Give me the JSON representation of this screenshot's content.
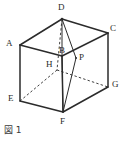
{
  "figure": {
    "caption": "図 1",
    "kind": "cube-diagram",
    "width": 124,
    "height": 141,
    "background_color": "#ffffff",
    "line_color": "#2b2b2b",
    "label_color": "#2b2b2b"
  },
  "labels": {
    "A": "A",
    "B": "B",
    "C": "C",
    "D": "D",
    "E": "E",
    "F": "F",
    "G": "G",
    "H": "H",
    "P": "P"
  },
  "geometry": {
    "vertices": {
      "A": {
        "x": 20,
        "y": 45
      },
      "B": {
        "x": 62,
        "y": 56
      },
      "C": {
        "x": 108,
        "y": 33
      },
      "D": {
        "x": 62,
        "y": 19
      },
      "E": {
        "x": 20,
        "y": 101
      },
      "F": {
        "x": 63,
        "y": 112
      },
      "G": {
        "x": 108,
        "y": 87
      },
      "H": {
        "x": 57,
        "y": 70
      },
      "P": {
        "x": 76,
        "y": 58
      }
    },
    "label_offsets": {
      "A": {
        "x": 6,
        "y": 39
      },
      "B": {
        "x": 59,
        "y": 46
      },
      "C": {
        "x": 110,
        "y": 24
      },
      "D": {
        "x": 58,
        "y": 3
      },
      "E": {
        "x": 8,
        "y": 94
      },
      "F": {
        "x": 60,
        "y": 117
      },
      "G": {
        "x": 112,
        "y": 80
      },
      "H": {
        "x": 46,
        "y": 60
      },
      "P": {
        "x": 79,
        "y": 53
      }
    },
    "solid_edges": [
      {
        "from": "A",
        "to": "D"
      },
      {
        "from": "D",
        "to": "C"
      },
      {
        "from": "A",
        "to": "B"
      },
      {
        "from": "B",
        "to": "C"
      },
      {
        "from": "A",
        "to": "E"
      },
      {
        "from": "B",
        "to": "F"
      },
      {
        "from": "C",
        "to": "G"
      },
      {
        "from": "E",
        "to": "F"
      },
      {
        "from": "F",
        "to": "G"
      }
    ],
    "dashed_edges": [
      {
        "from": "D",
        "to": "H"
      },
      {
        "from": "H",
        "to": "E"
      },
      {
        "from": "H",
        "to": "G"
      }
    ],
    "construction_lines": [
      {
        "from": "D",
        "to": "B"
      },
      {
        "from": "D",
        "to": "P"
      },
      {
        "from": "F",
        "to": "B"
      },
      {
        "from": "F",
        "to": "P"
      }
    ]
  }
}
